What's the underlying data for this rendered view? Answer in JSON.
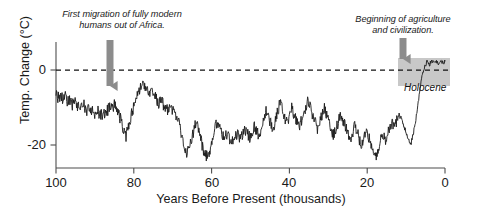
{
  "figure": {
    "background_color": "#ffffff",
    "line_color": "#1a1a1a",
    "arrow_color": "#8c8c8c",
    "holocene_box_color": "#b3b3b3",
    "axis_color": "#4d4d4d"
  },
  "annotations": {
    "left": {
      "text": "First migration of fully modern\nhumans out of Africa.",
      "arrow_x_kya": 86
    },
    "right": {
      "text": "Beginning of agriculture\nand civilization.",
      "arrow_x_kya": 11
    },
    "holocene_label": "Holocene"
  },
  "axes": {
    "x_title": "Years Before Present (thousands)",
    "y_title": "Temp. Change (°C)",
    "x_ticks": [
      "100",
      "80",
      "60",
      "40",
      "20",
      "0"
    ],
    "y_ticks": [
      "0",
      "-20"
    ]
  },
  "chart_data": {
    "type": "line",
    "title": "",
    "xlabel": "Years Before Present (thousands)",
    "ylabel": "Temp. Change (°C)",
    "xlim": [
      100,
      0
    ],
    "ylim": [
      -26,
      4
    ],
    "x_reversed": true,
    "grid": false,
    "legend": "none",
    "zero_reference_line": 0,
    "shaded_region": {
      "name": "Holocene",
      "x_start_kya": 11.5,
      "x_end_kya": 0,
      "y_start": -6.0,
      "y_end": 3.0
    },
    "x_unit": "thousands of years before present",
    "y_unit": "degrees Celsius relative to present",
    "x": [
      100.0,
      99.4,
      98.8,
      98.2,
      97.6,
      97.0,
      96.4,
      95.8,
      95.2,
      94.6,
      94.0,
      93.4,
      92.8,
      92.2,
      91.6,
      91.0,
      90.4,
      89.8,
      89.2,
      88.6,
      88.0,
      87.4,
      86.8,
      86.2,
      85.6,
      85.0,
      84.4,
      83.8,
      83.2,
      82.6,
      82.0,
      81.4,
      80.8,
      80.2,
      79.6,
      79.0,
      78.4,
      77.8,
      77.2,
      76.6,
      76.0,
      75.4,
      74.8,
      74.2,
      73.6,
      73.0,
      72.4,
      71.8,
      71.2,
      70.6,
      70.0,
      69.4,
      68.8,
      68.2,
      67.6,
      67.0,
      66.4,
      65.8,
      65.2,
      64.6,
      64.0,
      63.4,
      62.8,
      62.2,
      61.6,
      61.0,
      60.4,
      59.8,
      59.2,
      58.6,
      58.0,
      57.4,
      56.8,
      56.2,
      55.6,
      55.0,
      54.4,
      53.8,
      53.2,
      52.6,
      52.0,
      51.4,
      50.8,
      50.2,
      49.6,
      49.0,
      48.4,
      47.8,
      47.2,
      46.6,
      46.0,
      45.4,
      44.8,
      44.2,
      43.6,
      43.0,
      42.4,
      41.8,
      41.2,
      40.6,
      40.0,
      39.4,
      38.8,
      38.2,
      37.6,
      37.0,
      36.4,
      35.8,
      35.2,
      34.6,
      34.0,
      33.4,
      32.8,
      32.2,
      31.6,
      31.0,
      30.4,
      29.8,
      29.2,
      28.6,
      28.0,
      27.4,
      26.8,
      26.2,
      25.6,
      25.0,
      24.4,
      23.8,
      23.2,
      22.6,
      22.0,
      21.4,
      20.8,
      20.2,
      19.6,
      19.0,
      18.4,
      17.8,
      17.2,
      16.6,
      16.0,
      15.4,
      14.8,
      14.2,
      13.6,
      13.0,
      12.4,
      11.8,
      11.2,
      10.6,
      10.0,
      9.4,
      8.8,
      8.2,
      7.6,
      7.0,
      6.4,
      5.8,
      5.2,
      4.6,
      4.0,
      3.4,
      2.8,
      2.2,
      1.6,
      1.0,
      0.4,
      0.0
    ],
    "y": [
      -8.2,
      -9.3,
      -8.6,
      -9.8,
      -9.2,
      -10.4,
      -9.7,
      -11.0,
      -10.3,
      -11.5,
      -10.8,
      -11.9,
      -11.2,
      -12.4,
      -11.8,
      -12.9,
      -12.2,
      -13.2,
      -12.6,
      -13.6,
      -12.9,
      -13.8,
      -12.4,
      -11.2,
      -12.0,
      -11.0,
      -12.2,
      -13.4,
      -15.0,
      -17.4,
      -18.6,
      -16.2,
      -14.0,
      -12.2,
      -10.4,
      -8.8,
      -7.0,
      -5.8,
      -6.8,
      -7.6,
      -8.4,
      -7.8,
      -8.8,
      -9.6,
      -10.4,
      -9.8,
      -10.8,
      -11.6,
      -12.4,
      -11.6,
      -12.6,
      -13.4,
      -14.2,
      -16.0,
      -18.4,
      -20.6,
      -22.4,
      -21.0,
      -19.0,
      -17.2,
      -15.4,
      -17.0,
      -19.2,
      -21.4,
      -22.8,
      -23.6,
      -22.0,
      -19.4,
      -17.0,
      -15.2,
      -16.4,
      -17.6,
      -18.8,
      -17.8,
      -19.0,
      -20.0,
      -18.6,
      -17.4,
      -18.4,
      -19.4,
      -18.2,
      -16.8,
      -17.8,
      -18.8,
      -17.4,
      -16.0,
      -17.2,
      -18.4,
      -16.2,
      -14.0,
      -12.0,
      -13.6,
      -15.2,
      -16.8,
      -14.4,
      -12.4,
      -10.6,
      -12.2,
      -14.0,
      -15.6,
      -13.6,
      -11.8,
      -13.2,
      -14.8,
      -16.2,
      -14.8,
      -13.2,
      -11.6,
      -10.2,
      -11.8,
      -13.4,
      -15.0,
      -16.4,
      -15.0,
      -13.4,
      -12.0,
      -13.6,
      -15.2,
      -16.8,
      -18.2,
      -16.6,
      -14.8,
      -13.0,
      -14.6,
      -16.2,
      -17.8,
      -19.2,
      -17.6,
      -16.0,
      -17.6,
      -19.2,
      -20.6,
      -19.0,
      -17.4,
      -18.8,
      -20.2,
      -21.6,
      -23.0,
      -21.4,
      -19.6,
      -18.0,
      -19.4,
      -18.0,
      -16.4,
      -14.8,
      -16.2,
      -14.6,
      -13.0,
      -14.4,
      -16.0,
      -17.6,
      -19.0,
      -20.4,
      -18.0,
      -15.0,
      -11.0,
      -7.0,
      -3.4,
      -1.6,
      -0.8,
      -1.4,
      -0.6,
      -1.2,
      -0.5,
      -1.1,
      -0.4,
      -1.0,
      -0.5,
      -1.2,
      -0.6,
      -1.3,
      -0.7,
      -1.4,
      -0.8,
      -1.0
    ]
  }
}
